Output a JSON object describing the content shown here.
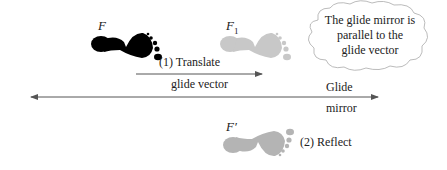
{
  "labels": {
    "F": "F",
    "F1_main": "F",
    "F1_sub": "1",
    "F_prime": "F′",
    "translate": "(1) Translate",
    "glide_vector": "glide vector",
    "reflect": "(2) Reflect",
    "glide_line1": "Glide",
    "glide_line2": "mirror"
  },
  "callout": {
    "line1": "The glide mirror is",
    "line2": "parallel to the",
    "line3": "glide vector"
  },
  "colors": {
    "original_footprint": "#000000",
    "image_footprint": "#c8c8c8",
    "reflected_footprint": "#b4b4b4",
    "lines": "#555555"
  }
}
